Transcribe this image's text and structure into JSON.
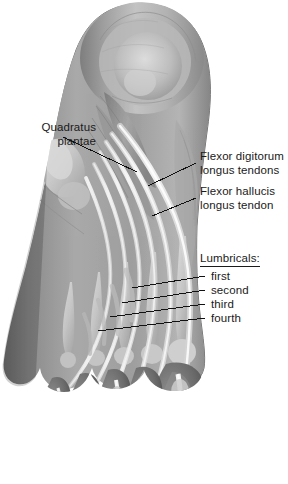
{
  "figure": {
    "background_color": "#ffffff",
    "text_color": "#1a1a1a",
    "width": 288,
    "height": 484
  },
  "annotations": {
    "quadratus_plantae": {
      "line1": "Quadratus",
      "line2": "plantae"
    },
    "flexor_digitorum": {
      "line1": "Flexor digitorum",
      "line2": "longus tendons"
    },
    "flexor_hallucis": {
      "line1": "Flexor hallucis",
      "line2": "longus tendon"
    },
    "lumbricals": {
      "heading": "Lumbricals:",
      "items": [
        "first",
        "second",
        "third",
        "fourth"
      ]
    }
  },
  "leader_lines": [
    {
      "name": "quadratus-plantae-leader",
      "x1": 63,
      "y1": 137,
      "x2": 137,
      "y2": 172
    },
    {
      "name": "flexor-digitorum-leader",
      "x1": 148,
      "y1": 186,
      "x2": 196,
      "y2": 163
    },
    {
      "name": "flexor-hallucis-leader",
      "x1": 152,
      "y1": 216,
      "x2": 196,
      "y2": 198
    },
    {
      "name": "lumbrical-first-leader",
      "x1": 132,
      "y1": 288,
      "x2": 205,
      "y2": 275
    },
    {
      "name": "lumbrical-second-leader",
      "x1": 122,
      "y1": 303,
      "x2": 205,
      "y2": 289
    },
    {
      "name": "lumbrical-third-leader",
      "x1": 110,
      "y1": 317,
      "x2": 205,
      "y2": 303
    },
    {
      "name": "lumbrical-fourth-leader",
      "x1": 98,
      "y1": 331,
      "x2": 205,
      "y2": 317
    }
  ]
}
